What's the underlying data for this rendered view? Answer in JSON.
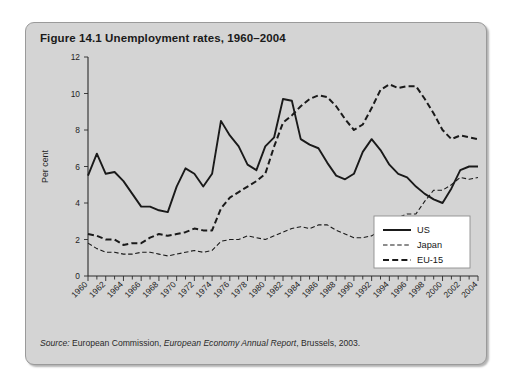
{
  "figure": {
    "title": "Figure 14.1  Unemployment rates, 1960–2004",
    "source_label": "Source:",
    "source_text_1": " European Commission, ",
    "source_work": "European Economy Annual Report",
    "source_text_2": ", Brussels, 2003."
  },
  "chart_data": {
    "type": "line",
    "title": "Unemployment rates, 1960–2004",
    "xlabel": "",
    "ylabel": "Per cent",
    "ylim": [
      0,
      12
    ],
    "yticks": [
      0,
      2,
      4,
      6,
      8,
      10,
      12
    ],
    "xlim": [
      1960,
      2004
    ],
    "xticks": [
      1960,
      1962,
      1964,
      1966,
      1968,
      1970,
      1972,
      1974,
      1976,
      1978,
      1980,
      1982,
      1984,
      1986,
      1988,
      1990,
      1992,
      1994,
      1996,
      1998,
      2000,
      2002,
      2004
    ],
    "minor_xticks_every": 1,
    "grid": false,
    "legend_position": "bottom-right",
    "x": [
      1960,
      1961,
      1962,
      1963,
      1964,
      1965,
      1966,
      1967,
      1968,
      1969,
      1970,
      1971,
      1972,
      1973,
      1974,
      1975,
      1976,
      1977,
      1978,
      1979,
      1980,
      1981,
      1982,
      1983,
      1984,
      1985,
      1986,
      1987,
      1988,
      1989,
      1990,
      1991,
      1992,
      1993,
      1994,
      1995,
      1996,
      1997,
      1998,
      1999,
      2000,
      2001,
      2002,
      2003,
      2004
    ],
    "series": [
      {
        "name": "US",
        "style": "solid",
        "values": [
          5.5,
          6.7,
          5.6,
          5.7,
          5.2,
          4.5,
          3.8,
          3.8,
          3.6,
          3.5,
          4.9,
          5.9,
          5.6,
          4.9,
          5.6,
          8.5,
          7.7,
          7.1,
          6.1,
          5.8,
          7.1,
          7.6,
          9.7,
          9.6,
          7.5,
          7.2,
          7.0,
          6.2,
          5.5,
          5.3,
          5.6,
          6.8,
          7.5,
          6.9,
          6.1,
          5.6,
          5.4,
          4.9,
          4.5,
          4.2,
          4.0,
          4.8,
          5.8,
          6.0,
          6.0
        ]
      },
      {
        "name": "Japan",
        "style": "dashed-thin",
        "values": [
          1.8,
          1.5,
          1.3,
          1.3,
          1.2,
          1.2,
          1.3,
          1.3,
          1.2,
          1.1,
          1.2,
          1.3,
          1.4,
          1.3,
          1.4,
          1.9,
          2.0,
          2.0,
          2.2,
          2.1,
          2.0,
          2.2,
          2.4,
          2.6,
          2.7,
          2.6,
          2.8,
          2.8,
          2.5,
          2.3,
          2.1,
          2.1,
          2.2,
          2.5,
          2.9,
          3.2,
          3.4,
          3.4,
          4.1,
          4.7,
          4.7,
          5.0,
          5.4,
          5.3,
          5.4
        ]
      },
      {
        "name": "EU-15",
        "style": "dashed-thick",
        "values": [
          2.3,
          2.2,
          2.0,
          2.0,
          1.7,
          1.8,
          1.8,
          2.1,
          2.3,
          2.2,
          2.3,
          2.4,
          2.6,
          2.5,
          2.5,
          3.7,
          4.3,
          4.6,
          4.9,
          5.2,
          5.6,
          7.1,
          8.4,
          8.8,
          9.3,
          9.7,
          9.9,
          9.8,
          9.3,
          8.6,
          8.0,
          8.3,
          9.2,
          10.2,
          10.5,
          10.3,
          10.4,
          10.4,
          9.7,
          8.9,
          8.0,
          7.5,
          7.7,
          7.6,
          7.5
        ]
      }
    ],
    "legend": [
      {
        "label": "US",
        "style": "solid"
      },
      {
        "label": "Japan",
        "style": "dashed-thin"
      },
      {
        "label": "EU-15",
        "style": "dashed-thick"
      }
    ]
  }
}
